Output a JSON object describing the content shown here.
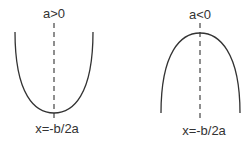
{
  "diagram": {
    "left": {
      "top_label": "a>0",
      "bottom_label": "x=-b/2a",
      "shape": "upward-parabola"
    },
    "right": {
      "top_label": "a<0",
      "bottom_label": "x=-b/2a",
      "shape": "downward-parabola"
    },
    "colors": {
      "curve": "#333333",
      "axis": "#444444",
      "text": "#333333",
      "background": "#ffffff"
    }
  }
}
